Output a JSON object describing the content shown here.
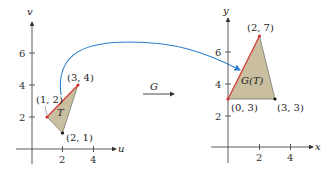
{
  "colors": {
    "region_fill": "#c9bfa0",
    "edge_highlight": "#e0403a",
    "arrow_curve": "#2f7fd0",
    "axis": "#333333"
  },
  "left_plot": {
    "x_axis_label": "u",
    "y_axis_label": "v",
    "x_ticks": [
      "2",
      "4"
    ],
    "y_ticks": [
      "2",
      "4",
      "6"
    ],
    "region_label": "T",
    "points": [
      {
        "label": "(1, 2)",
        "u": 1,
        "v": 2
      },
      {
        "label": "(3, 4)",
        "u": 3,
        "v": 4
      },
      {
        "label": "(2, 1)",
        "u": 2,
        "v": 1
      }
    ]
  },
  "right_plot": {
    "x_axis_label": "x",
    "y_axis_label": "y",
    "x_ticks": [
      "2",
      "4"
    ],
    "y_ticks": [
      "2",
      "4",
      "6"
    ],
    "region_label": "G(T)",
    "points": [
      {
        "label": "(2, 7)",
        "x": 2,
        "y": 7
      },
      {
        "label": "(0, 3)",
        "x": 0,
        "y": 3
      },
      {
        "label": "(3, 3)",
        "x": 3,
        "y": 3
      }
    ]
  },
  "transform": {
    "label": "G"
  }
}
